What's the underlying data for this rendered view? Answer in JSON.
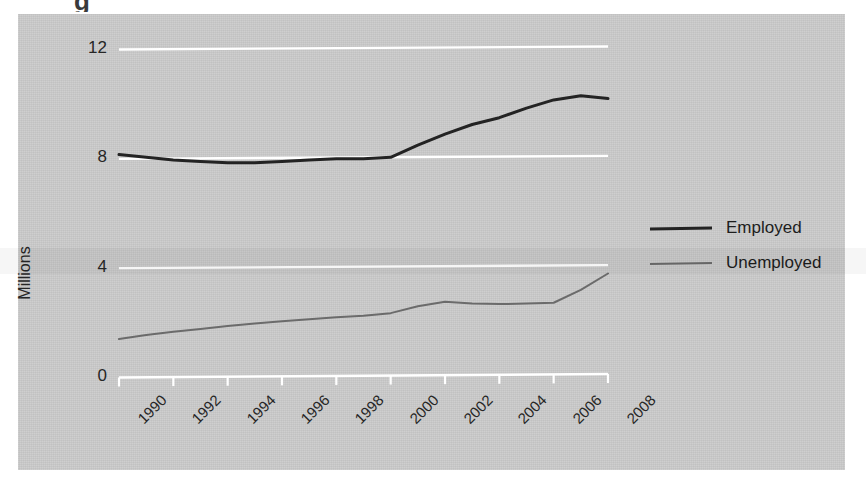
{
  "figure": {
    "page_crumb": "g",
    "ylabel": "Millions",
    "panel_color": "#c9c9c9",
    "gridline_color": "#ffffff",
    "axis_color": "#ffffff"
  },
  "legend": {
    "position": "right",
    "items": [
      {
        "label": "Employed",
        "color": "#232323",
        "width": 3
      },
      {
        "label": "Unemployed",
        "color": "#6b6b6b",
        "width": 2
      }
    ]
  },
  "chart_data": {
    "type": "line",
    "title": "",
    "subtitle": "",
    "xlabel": "",
    "ylabel": "Millions",
    "xlim": [
      1990,
      2008
    ],
    "ylim": [
      0,
      12
    ],
    "yticks": [
      0,
      4,
      8,
      12
    ],
    "ytick_labels": [
      "0",
      "4",
      "8",
      "12"
    ],
    "xticks": [
      1990,
      1991,
      1992,
      1993,
      1994,
      1995,
      1996,
      1997,
      1998,
      1999,
      2000,
      2001,
      2002,
      2003,
      2004,
      2005,
      2006,
      2007,
      2008
    ],
    "xtick_labels": [
      "1990",
      "1992",
      "1994",
      "1996",
      "1998",
      "2000",
      "2002",
      "2004",
      "2006",
      "2008"
    ],
    "xtick_label_values": [
      1990,
      1992,
      1994,
      1996,
      1998,
      2000,
      2002,
      2004,
      2006,
      2008
    ],
    "xtick_label_rotation": -45,
    "grid": "horizontal",
    "x": [
      1990,
      1991,
      1992,
      1993,
      1994,
      1995,
      1996,
      1997,
      1998,
      1999,
      2000,
      2001,
      2002,
      2003,
      2004,
      2005,
      2006,
      2007,
      2008
    ],
    "series": [
      {
        "name": "Employed",
        "color": "#232323",
        "width": 3,
        "values": [
          8.1,
          8.0,
          7.9,
          7.85,
          7.8,
          7.8,
          7.85,
          7.9,
          7.95,
          7.95,
          8.0,
          8.45,
          8.85,
          9.2,
          9.45,
          9.8,
          10.1,
          10.25,
          10.15
        ]
      },
      {
        "name": "Unemployed",
        "color": "#6b6b6b",
        "width": 2,
        "values": [
          1.35,
          1.5,
          1.62,
          1.72,
          1.83,
          1.92,
          2.0,
          2.08,
          2.15,
          2.2,
          2.3,
          2.55,
          2.72,
          2.65,
          2.63,
          2.65,
          2.68,
          3.15,
          3.75
        ]
      }
    ]
  }
}
